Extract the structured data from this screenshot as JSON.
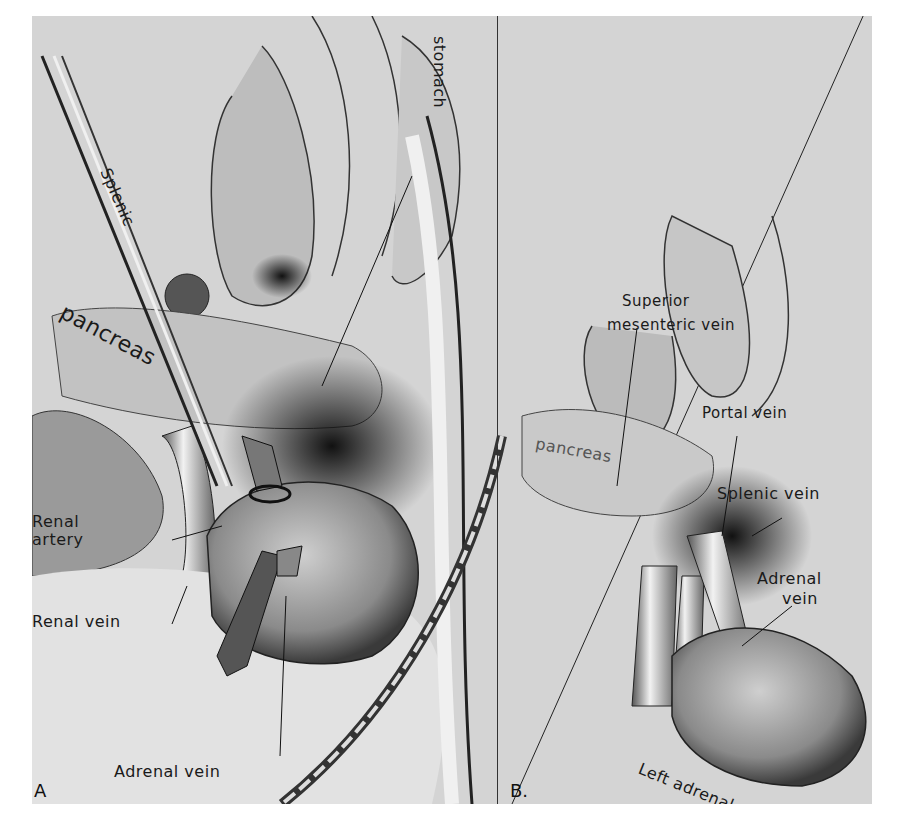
{
  "figure": {
    "panels": [
      {
        "id": "A",
        "letter": "A",
        "labels": {
          "splenic": "Splenic",
          "stomach": "stomach",
          "pancreas": "pancreas",
          "renal_artery_line1": "Renal",
          "renal_artery_line2": "artery",
          "renal_vein": "Renal vein",
          "adrenal_vein": "Adrenal vein"
        }
      },
      {
        "id": "B",
        "letter": "B.",
        "labels": {
          "superior_mesenteric_line1": "Superior",
          "superior_mesenteric_line2": "mesenteric vein",
          "portal_vein": "Portal vein",
          "pancreas": "pancreas",
          "splenic_vein": "Splenic vein",
          "adrenal_vein_line1": "Adrenal",
          "adrenal_vein_line2": "vein",
          "left_adrenal": "Left adrenal"
        }
      }
    ],
    "colors": {
      "background": "#d4d4d4",
      "ink": "#1a1a1a",
      "shadow": "#3a3a3a",
      "highlight": "#eeeeee"
    }
  }
}
